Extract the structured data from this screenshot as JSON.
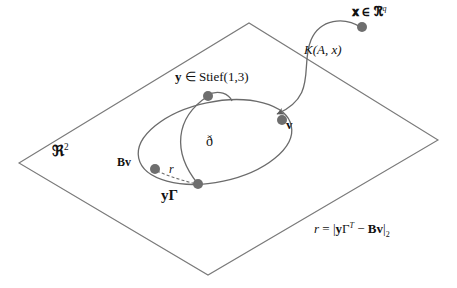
{
  "figure": {
    "width": 457,
    "height": 288,
    "background_color": "#ffffff",
    "line_color": "#6b6b6b",
    "plane_edge_color": "#7a7a7a",
    "dot_color": "#6e6e6e",
    "text_color": "#111111"
  },
  "labels": {
    "ambient_point": "𝐱 ∈ ℜ",
    "ambient_point_sup": "q",
    "map_label": "K(A, x)",
    "stiefel_point": "y ∈ Stief(1,3)",
    "projected_point": "v",
    "manifold_name": "ð",
    "Bv_point": "Bv",
    "residual_segment": "r",
    "y_gamma_point": "yΓ",
    "plane_name": "ℜ",
    "plane_name_sup": "2",
    "equation": "r = |yΓ",
    "equation_sup": "T",
    "equation_rest": " − Bv|",
    "equation_sub": "2"
  },
  "geometry": {
    "plane_polygon_points": "19,163 249,23 438,140 208,275",
    "ellipse": {
      "cx": 215,
      "cy": 142,
      "rx": 78,
      "ry": 40,
      "rotation_deg": -12
    },
    "points": [
      {
        "name": "x",
        "x": 362,
        "y": 27,
        "r": 5
      },
      {
        "name": "v",
        "x": 282,
        "y": 120,
        "r": 5
      },
      {
        "name": "y",
        "x": 208,
        "y": 96,
        "r": 5
      },
      {
        "name": "Bv",
        "x": 155,
        "y": 169,
        "r": 5
      },
      {
        "name": "yGamma",
        "x": 198,
        "y": 184,
        "r": 5
      }
    ],
    "curves": {
      "K_map_arc": "M362,28 C344,16 320,19 311,40 C300,66 318,96 277,114",
      "stief_fiber": "M208,96 C175,118 172,152 198,184",
      "small_arc_at_y": "M207,95 C219,89 229,94 232,101",
      "residual_dash": "M157,171 C170,177 185,181 196,184"
    }
  }
}
